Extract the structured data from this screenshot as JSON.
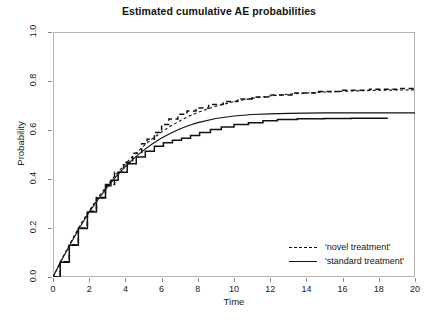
{
  "chart_data": {
    "type": "line",
    "title": "Estimated cumulative AE probabilities",
    "xlabel": "Time",
    "ylabel": "Probability",
    "xlim": [
      0,
      20
    ],
    "ylim": [
      0,
      1.0
    ],
    "xticks": [
      0,
      2,
      4,
      6,
      8,
      10,
      12,
      14,
      16,
      18,
      20
    ],
    "yticks": [
      0.0,
      0.2,
      0.4,
      0.6,
      0.8,
      1.0
    ],
    "xticklabels": [
      "0",
      "2",
      "4",
      "6",
      "8",
      "10",
      "12",
      "14",
      "16",
      "18",
      "20"
    ],
    "yticklabels": [
      "0.0",
      "0.2",
      "0.4",
      "0.6",
      "0.8",
      "1.0"
    ],
    "grid": false,
    "legend_position": "bottom-right",
    "series": [
      {
        "name": "'novel treatment' (parametric)",
        "style": "dashed",
        "color": "#111111",
        "x": [
          0,
          0.5,
          1,
          1.5,
          2,
          2.5,
          3,
          3.5,
          4,
          4.5,
          5,
          5.5,
          6,
          6.5,
          7,
          7.5,
          8,
          9,
          10,
          11,
          12,
          13,
          14,
          15,
          16,
          17,
          18,
          19,
          20
        ],
        "y": [
          0.0,
          0.075,
          0.145,
          0.212,
          0.272,
          0.325,
          0.375,
          0.42,
          0.462,
          0.5,
          0.534,
          0.565,
          0.592,
          0.616,
          0.637,
          0.656,
          0.672,
          0.697,
          0.716,
          0.729,
          0.739,
          0.746,
          0.751,
          0.755,
          0.758,
          0.76,
          0.762,
          0.763,
          0.764
        ]
      },
      {
        "name": "'novel treatment' (Aalen-Johansen)",
        "style": "dashed-step",
        "color": "#111111",
        "x": [
          0,
          0.4,
          0.9,
          1.4,
          1.9,
          2.4,
          2.9,
          3.4,
          3.9,
          4.4,
          4.9,
          5.2,
          5.6,
          6.0,
          6.4,
          6.9,
          7.4,
          7.9,
          8.6,
          9.4,
          10.2,
          11.0,
          12.0,
          13.2,
          14.5,
          16.0,
          17.5,
          19.0,
          20
        ],
        "y": [
          0.0,
          0.062,
          0.132,
          0.2,
          0.268,
          0.325,
          0.378,
          0.428,
          0.468,
          0.505,
          0.544,
          0.562,
          0.59,
          0.622,
          0.645,
          0.664,
          0.678,
          0.69,
          0.704,
          0.716,
          0.727,
          0.735,
          0.743,
          0.751,
          0.757,
          0.762,
          0.766,
          0.769,
          0.77
        ]
      },
      {
        "name": "'standard treatment' (parametric)",
        "style": "solid",
        "color": "#111111",
        "x": [
          0,
          0.5,
          1,
          1.5,
          2,
          2.5,
          3,
          3.5,
          4,
          4.5,
          5,
          5.5,
          6,
          6.5,
          7,
          7.5,
          8,
          9,
          10,
          11,
          12,
          13,
          14,
          15,
          16,
          17,
          18,
          19,
          20
        ],
        "y": [
          0.0,
          0.072,
          0.14,
          0.205,
          0.265,
          0.318,
          0.367,
          0.411,
          0.451,
          0.486,
          0.517,
          0.544,
          0.567,
          0.587,
          0.604,
          0.618,
          0.63,
          0.647,
          0.657,
          0.663,
          0.666,
          0.668,
          0.669,
          0.67,
          0.67,
          0.67,
          0.67,
          0.67,
          0.67
        ]
      },
      {
        "name": "'standard treatment' (Aalen-Johansen)",
        "style": "solid-step",
        "color": "#111111",
        "x": [
          0,
          0.4,
          0.9,
          1.4,
          1.9,
          2.4,
          2.9,
          3.2,
          3.6,
          4.1,
          4.6,
          5.1,
          5.6,
          6.1,
          6.6,
          7.1,
          7.6,
          8.1,
          8.7,
          9.3,
          10.0,
          10.8,
          11.6,
          12.4,
          13.5,
          15.0,
          16.5,
          18.5
        ],
        "y": [
          0.0,
          0.06,
          0.13,
          0.198,
          0.265,
          0.322,
          0.372,
          0.395,
          0.428,
          0.462,
          0.49,
          0.513,
          0.534,
          0.548,
          0.558,
          0.566,
          0.578,
          0.59,
          0.602,
          0.612,
          0.622,
          0.63,
          0.638,
          0.643,
          0.646,
          0.647,
          0.648,
          0.648
        ]
      }
    ],
    "legend": [
      {
        "label": "'novel treatment'",
        "style": "dashed"
      },
      {
        "label": "'standard treatment'",
        "style": "solid"
      }
    ]
  }
}
